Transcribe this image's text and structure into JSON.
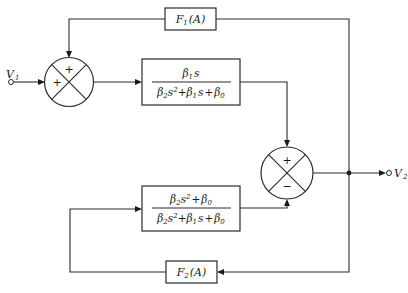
{
  "diagram": {
    "type": "block-diagram",
    "input": {
      "label": "V",
      "subscript": "1"
    },
    "output": {
      "label": "V",
      "subscript": "2"
    },
    "summing_junction_left": {
      "signs": [
        "+",
        "+"
      ]
    },
    "summing_junction_right": {
      "signs": [
        "+",
        "−"
      ]
    },
    "blocks": [
      {
        "id": "F1",
        "name": "F",
        "subscript": "1",
        "arg": "(A)"
      },
      {
        "id": "bandpass",
        "numerator": {
          "b": "β",
          "b_sub": "1",
          "var": "s"
        },
        "denominator": {
          "t1b": "β",
          "t1sub": "2",
          "t1var": "s",
          "t1sup": "2",
          "plus1": "+",
          "t2b": "β",
          "t2sub": "1",
          "t2var": "s",
          "plus2": "+",
          "t3b": "β",
          "t3sub": "0"
        }
      },
      {
        "id": "notch",
        "numerator": {
          "t1b": "β",
          "t1sub": "2",
          "t1var": "s",
          "t1sup": "2",
          "plus": "+",
          "t2b": "β",
          "t2sub": "0"
        },
        "denominator": {
          "t1b": "β",
          "t1sub": "2",
          "t1var": "s",
          "t1sup": "2",
          "plus1": "+",
          "t2b": "β",
          "t2sub": "1",
          "t2var": "s",
          "plus2": "+",
          "t3b": "β",
          "t3sub": "0"
        }
      },
      {
        "id": "F2",
        "name": "F",
        "subscript": "2",
        "arg": "(A)"
      }
    ]
  }
}
